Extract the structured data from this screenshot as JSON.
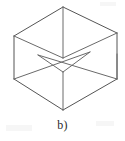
{
  "figure": {
    "caption": "b)",
    "background_color": "#ffffff",
    "line_color": "#555555",
    "inner_line_color": "#6a6a6a",
    "caption_color": "#2b2b2b",
    "line_width": 1.0,
    "canvas": {
      "width": 125,
      "height": 141
    },
    "geometry": {
      "description": "Hexagonal isometric outline of a cube seen from above-front, with visible interior faces of an open box",
      "vertices": {
        "top_apex": [
          63,
          7
        ],
        "upper_left": [
          14,
          36
        ],
        "upper_right": [
          117,
          33
        ],
        "lower_left": [
          14,
          79
        ],
        "lower_right": [
          117,
          79
        ],
        "bottom_apex": [
          63,
          110
        ],
        "center_top": [
          63,
          58
        ],
        "inner_left": [
          38,
          55
        ],
        "inner_right": [
          90,
          52
        ],
        "inner_front": [
          63,
          72
        ],
        "rim_right_low": [
          117,
          54
        ]
      },
      "edges": [
        {
          "name": "outline-top-left",
          "from": "top_apex",
          "to": "upper_left"
        },
        {
          "name": "outline-top-right",
          "from": "top_apex",
          "to": "upper_right"
        },
        {
          "name": "outline-left-vert",
          "from": "upper_left",
          "to": "lower_left"
        },
        {
          "name": "outline-right-vert",
          "from": "upper_right",
          "to": "lower_right"
        },
        {
          "name": "outline-bottom-left",
          "from": "lower_left",
          "to": "bottom_apex"
        },
        {
          "name": "outline-bottom-right",
          "from": "lower_right",
          "to": "bottom_apex"
        },
        {
          "name": "center-vertical-upper",
          "from": "top_apex",
          "to": "center_top"
        },
        {
          "name": "center-vertical-lower",
          "from": "inner_front",
          "to": "bottom_apex"
        },
        {
          "name": "inner-rim-left-back",
          "from": "upper_left",
          "to": "center_top"
        },
        {
          "name": "inner-rim-right-back",
          "from": "upper_right",
          "to": "center_top"
        },
        {
          "name": "inner-rim-left-front",
          "from": "lower_left",
          "to": "inner_right"
        },
        {
          "name": "inner-rim-right-front",
          "from": "lower_right",
          "to": "inner_left"
        },
        {
          "name": "inner-floor-left",
          "from": "inner_left",
          "to": "inner_front"
        },
        {
          "name": "inner-floor-right",
          "from": "inner_right",
          "to": "inner_front"
        },
        {
          "name": "rim-band-right",
          "from": "rim_right_low",
          "to": "lower_right"
        }
      ]
    }
  }
}
